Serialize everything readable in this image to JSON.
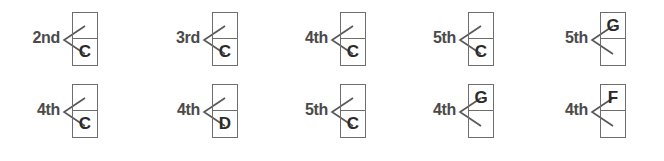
{
  "rows": [
    {
      "items": [
        {
          "interval": "2nd",
          "top_note": "",
          "bottom_note": "C"
        },
        {
          "interval": "3rd",
          "top_note": "",
          "bottom_note": "C"
        },
        {
          "interval": "4th",
          "top_note": "",
          "bottom_note": "C"
        },
        {
          "interval": "5th",
          "top_note": "",
          "bottom_note": "C"
        },
        {
          "interval": "5th",
          "top_note": "G",
          "bottom_note": ""
        }
      ]
    },
    {
      "items": [
        {
          "interval": "4th",
          "top_note": "",
          "bottom_note": "C"
        },
        {
          "interval": "4th",
          "top_note": "",
          "bottom_note": "D"
        },
        {
          "interval": "5th",
          "top_note": "",
          "bottom_note": "C"
        },
        {
          "interval": "4th",
          "top_note": "G",
          "bottom_note": ""
        },
        {
          "interval": "4th",
          "top_note": "F",
          "bottom_note": ""
        }
      ]
    }
  ]
}
